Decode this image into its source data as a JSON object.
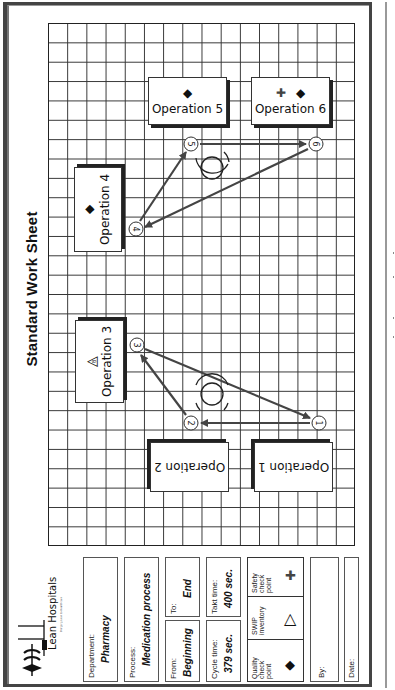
{
  "header": {
    "title": "Standard Work Sheet",
    "logo_text": "Lean Hospitals",
    "logo_tagline": "Bringing Lean to Healthcare"
  },
  "operations": [
    {
      "id": 1,
      "label": "Operation 1",
      "symbols": []
    },
    {
      "id": 2,
      "label": "Operation 2",
      "symbols": []
    },
    {
      "id": 3,
      "label": "Operation 3",
      "symbols": [
        "swip-triangle"
      ],
      "swip_count": "8"
    },
    {
      "id": 4,
      "label": "Operation 4",
      "symbols": [
        "quality-diamond"
      ]
    },
    {
      "id": 5,
      "label": "Operation 5",
      "symbols": [
        "quality-diamond"
      ]
    },
    {
      "id": 6,
      "label": "Operation 6",
      "symbols": [
        "safety-cross",
        "quality-diamond"
      ]
    }
  ],
  "steps": [
    "1",
    "2",
    "3",
    "4",
    "5",
    "6"
  ],
  "info": {
    "department_label": "Department:",
    "department_value": "Pharmacy",
    "process_label": "Process:",
    "process_value": "Medication process",
    "from_label": "From:",
    "from_value": "Beginning",
    "to_label": "To:",
    "to_value": "End",
    "cycle_label": "Cycle time:",
    "cycle_value": "379 sec.",
    "takt_label": "Takt time:",
    "takt_value": "400 sec.",
    "legend": {
      "quality": "Quality check point",
      "swip": "SWIP inventory",
      "safety": "Safety check point"
    },
    "by_label": "By:",
    "date_label": "Date:"
  },
  "icons": {
    "diamond": "◆",
    "cross": "✚",
    "triangle": "△"
  },
  "colors": {
    "ink": "#222222",
    "arrow": "#444444",
    "grid": "#333333"
  }
}
